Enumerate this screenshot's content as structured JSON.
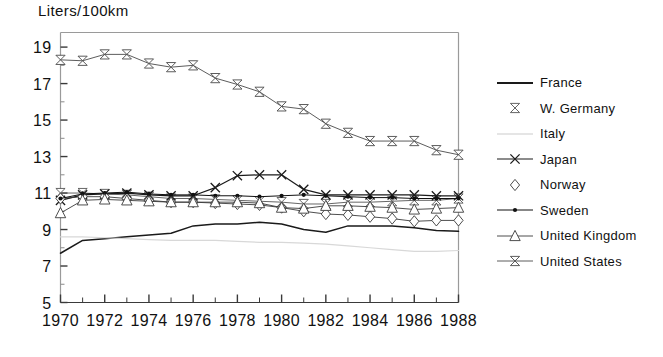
{
  "chart_data": {
    "type": "line",
    "title": "Liters/100km",
    "xlabel": "",
    "ylabel": "",
    "ylim": [
      5,
      19.8
    ],
    "xlim": [
      1970,
      1988
    ],
    "grid": false,
    "legend_position": "right",
    "y_ticks": [
      5,
      7,
      9,
      11,
      13,
      15,
      17,
      19
    ],
    "y_tick_labels": [
      "5",
      "7",
      "9",
      "11",
      "13",
      "15",
      "17",
      "19"
    ],
    "y_minor_ticks": [
      6,
      8,
      10,
      12,
      14,
      16,
      18
    ],
    "x": [
      1970,
      1971,
      1972,
      1973,
      1974,
      1975,
      1976,
      1977,
      1978,
      1979,
      1980,
      1981,
      1982,
      1983,
      1984,
      1985,
      1986,
      1987,
      1988
    ],
    "x_ticks": [
      1970,
      1971,
      1972,
      1973,
      1974,
      1975,
      1976,
      1977,
      1978,
      1979,
      1980,
      1981,
      1982,
      1983,
      1984,
      1985,
      1986,
      1987,
      1988
    ],
    "x_tick_labels": [
      "1970",
      "",
      "1972",
      "",
      "1974",
      "",
      "1976",
      "",
      "1978",
      "",
      "1980",
      "",
      "1982",
      "",
      "1984",
      "",
      "1986",
      "",
      "1988"
    ],
    "series": [
      {
        "name": "France",
        "marker": "none",
        "color": "#1a1a1a",
        "width": 1.5,
        "values": [
          7.7,
          8.4,
          8.5,
          8.6,
          8.7,
          8.8,
          9.2,
          9.3,
          9.3,
          9.4,
          9.3,
          9.0,
          8.85,
          9.2,
          9.2,
          9.2,
          9.1,
          8.95,
          8.9
        ]
      },
      {
        "name": "Italy",
        "marker": "none",
        "color": "#d8d8d8",
        "width": 1.2,
        "values": [
          8.6,
          8.6,
          8.55,
          8.5,
          8.45,
          8.4,
          8.4,
          8.4,
          8.35,
          8.3,
          8.3,
          8.25,
          8.2,
          8.1,
          8.0,
          7.9,
          7.8,
          7.8,
          7.85
        ]
      },
      {
        "name": "W. Germany",
        "marker": "bowtie",
        "color": "#555555",
        "width": 0.9,
        "values": [
          11.0,
          11.0,
          10.95,
          10.9,
          10.8,
          10.7,
          10.7,
          10.65,
          10.6,
          10.55,
          10.5,
          10.4,
          10.4,
          10.5,
          10.5,
          10.55,
          10.6,
          10.6,
          10.7
        ]
      },
      {
        "name": "Japan",
        "marker": "x",
        "color": "#1a1a1a",
        "width": 1.2,
        "values": [
          10.6,
          10.9,
          10.95,
          11.0,
          10.9,
          10.85,
          10.85,
          11.3,
          11.95,
          12.0,
          12.0,
          11.2,
          10.9,
          10.9,
          10.9,
          10.9,
          10.9,
          10.85,
          10.85
        ]
      },
      {
        "name": "Norway",
        "marker": "diamond",
        "color": "#3a3a3a",
        "width": 0.9,
        "values": [
          10.7,
          10.8,
          10.8,
          10.7,
          10.6,
          10.5,
          10.5,
          10.45,
          10.4,
          10.35,
          10.2,
          10.0,
          9.85,
          9.8,
          9.7,
          9.6,
          9.45,
          9.5,
          9.5
        ]
      },
      {
        "name": "Sweden",
        "marker": "dot",
        "color": "#111111",
        "width": 1.0,
        "values": [
          10.7,
          10.95,
          11.0,
          11.05,
          10.95,
          10.9,
          10.9,
          10.85,
          10.85,
          10.8,
          10.85,
          10.9,
          10.85,
          10.8,
          10.75,
          10.75,
          10.7,
          10.7,
          10.7
        ]
      },
      {
        "name": "United Kingdom",
        "marker": "triangle",
        "color": "#3a3a3a",
        "width": 0.9,
        "values": [
          9.9,
          10.6,
          10.65,
          10.6,
          10.55,
          10.5,
          10.5,
          10.5,
          10.5,
          10.45,
          10.2,
          10.15,
          10.3,
          10.3,
          10.25,
          10.2,
          10.1,
          10.15,
          10.2
        ]
      },
      {
        "name": "United States",
        "marker": "bowtie-line",
        "color": "#4a4a4a",
        "width": 0.9,
        "values": [
          18.3,
          18.25,
          18.6,
          18.6,
          18.1,
          17.9,
          18.0,
          17.3,
          16.95,
          16.55,
          15.75,
          15.6,
          14.8,
          14.3,
          13.85,
          13.85,
          13.85,
          13.35,
          13.1
        ]
      }
    ]
  },
  "legend": {
    "items": [
      {
        "label": "France",
        "key": "line-plain"
      },
      {
        "label": "W. Germany",
        "key": "bowtie"
      },
      {
        "label": "Italy",
        "key": "line-faint"
      },
      {
        "label": "Japan",
        "key": "x-line"
      },
      {
        "label": "Norway",
        "key": "diamond"
      },
      {
        "label": "Sweden",
        "key": "dot-line"
      },
      {
        "label": "United Kingdom",
        "key": "triangle-line"
      },
      {
        "label": "United States",
        "key": "bowtie-line"
      }
    ]
  }
}
